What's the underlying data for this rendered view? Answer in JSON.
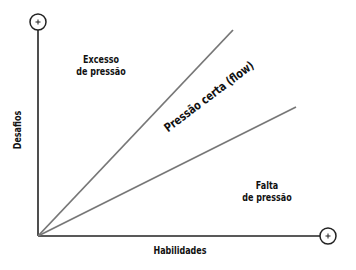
{
  "diagram": {
    "axes": {
      "x_label": "Habilidades",
      "y_label": "Desafios",
      "x_end_marker": "+",
      "y_end_marker": "+"
    },
    "regions": {
      "excess_line1": "Excesso",
      "excess_line2": "de pressão",
      "flow": "Pressão certa (flow)",
      "lack_line1": "Falta",
      "lack_line2": "de pressão"
    },
    "colors": {
      "axis": "#222222",
      "boundary_lines": "#777777",
      "text": "#111111"
    }
  }
}
